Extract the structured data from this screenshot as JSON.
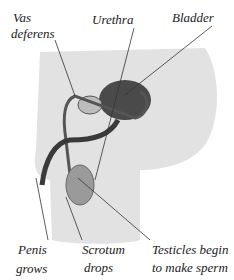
{
  "diagram": {
    "labels": {
      "vas_deferens_1": "Vas",
      "vas_deferens_2": "deferens",
      "urethra": "Urethra",
      "bladder": "Bladder",
      "penis_1": "Penis",
      "penis_2": "grows",
      "scrotum_1": "Scrotum",
      "scrotum_2": "drops",
      "testicles_1": "Testicles begin",
      "testicles_2": "to make sperm"
    },
    "colors": {
      "body": "#e2e2e2",
      "organ": "#4a4a4a",
      "line": "#333333"
    }
  }
}
